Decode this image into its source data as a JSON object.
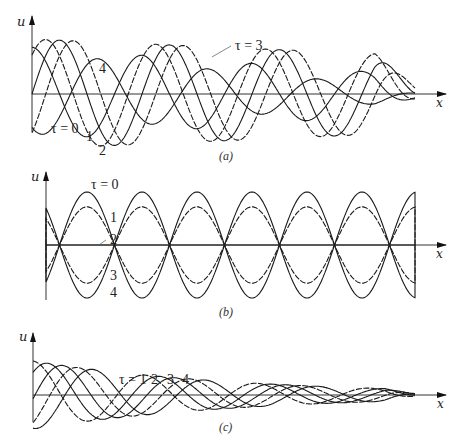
{
  "figure": {
    "panels": [
      {
        "id": "a",
        "caption": "(a)",
        "y_label": "u",
        "x_label": "x",
        "curve_labels": [
          {
            "text": "τ = 3",
            "x": 237,
            "y": 47
          },
          {
            "text": "4",
            "x": 99,
            "y": 72
          },
          {
            "text": "τ = 0",
            "x": 52,
            "y": 133
          },
          {
            "text": "1",
            "x": 86,
            "y": 140
          },
          {
            "text": "2",
            "x": 100,
            "y": 153
          }
        ]
      },
      {
        "id": "b",
        "caption": "(b)",
        "y_label": "u",
        "x_label": "x",
        "curve_labels": [
          {
            "text": "τ = 0",
            "x": 92,
            "y": 188
          },
          {
            "text": "1",
            "x": 110,
            "y": 220
          },
          {
            "text": "2",
            "x": 110,
            "y": 244
          },
          {
            "text": "3",
            "x": 110,
            "y": 277
          },
          {
            "text": "4",
            "x": 110,
            "y": 297
          }
        ]
      },
      {
        "id": "c",
        "caption": "(c)",
        "y_label": "u",
        "x_label": "x",
        "curve_labels": [
          {
            "text": "τ = 1",
            "x": 120,
            "y": 383
          },
          {
            "text": "2",
            "x": 152,
            "y": 383
          },
          {
            "text": "3",
            "x": 168,
            "y": 383
          },
          {
            "text": "4",
            "x": 183,
            "y": 383
          }
        ]
      }
    ]
  },
  "chart_data": [
    {
      "type": "line",
      "title": "(a)",
      "xlabel": "x",
      "ylabel": "u",
      "description": "Wave with decaying envelope propagating in +x for time steps tau=0..4; curves converge to zero at the right end",
      "series": [
        {
          "name": "τ=0",
          "phase": 0.0,
          "style": "solid"
        },
        {
          "name": "τ=1",
          "phase": 0.5,
          "style": "dashed"
        },
        {
          "name": "τ=2",
          "phase": 1.0,
          "style": "solid"
        },
        {
          "name": "τ=3",
          "phase": 1.5,
          "style": "dashed"
        },
        {
          "name": "τ=4",
          "phase": 2.4,
          "style": "solid"
        }
      ],
      "grid": false
    },
    {
      "type": "line",
      "title": "(b)",
      "xlabel": "x",
      "ylabel": "u",
      "description": "Standing wave: fixed nodes, amplitude varies cos-like with tau",
      "series": [
        {
          "name": "τ=0",
          "amplitude": 1.0,
          "style": "solid"
        },
        {
          "name": "τ=1",
          "amplitude": 0.72,
          "style": "dashed"
        },
        {
          "name": "τ=2",
          "amplitude": 0.0,
          "style": "solid"
        },
        {
          "name": "τ=3",
          "amplitude": -0.72,
          "style": "dashed"
        },
        {
          "name": "τ=4",
          "amplitude": -1.0,
          "style": "solid"
        }
      ],
      "nodes_count": 6,
      "grid": false
    },
    {
      "type": "line",
      "title": "(c)",
      "xlabel": "x",
      "ylabel": "u",
      "description": "Damped traveling wave shifting right with increasing tau",
      "series": [
        {
          "name": "τ=0",
          "shift": 0,
          "style": "dashed"
        },
        {
          "name": "τ=1",
          "shift": 1,
          "style": "solid"
        },
        {
          "name": "τ=2",
          "shift": 2,
          "style": "solid"
        },
        {
          "name": "τ=3",
          "shift": 3,
          "style": "dashed"
        },
        {
          "name": "τ=4",
          "shift": 4,
          "style": "solid"
        }
      ],
      "grid": false
    }
  ]
}
